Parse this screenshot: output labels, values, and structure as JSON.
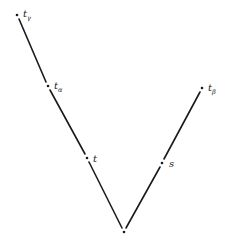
{
  "diagram": {
    "type": "spacetime-v-diagram",
    "points": [
      {
        "id": "t_gamma",
        "label": "t",
        "subscript": "γ",
        "x": 17,
        "y": 15,
        "lx": 23,
        "ly": 16
      },
      {
        "id": "t_alpha",
        "label": "t",
        "subscript": "α",
        "x": 48,
        "y": 86,
        "lx": 54,
        "ly": 88
      },
      {
        "id": "t",
        "label": "t",
        "subscript": "",
        "x": 87,
        "y": 158,
        "lx": 93,
        "ly": 161
      },
      {
        "id": "s",
        "label": "s",
        "subscript": "",
        "x": 162,
        "y": 163,
        "lx": 169,
        "ly": 166
      },
      {
        "id": "t_beta",
        "label": "t",
        "subscript": "β",
        "x": 202,
        "y": 88,
        "lx": 208,
        "ly": 90
      },
      {
        "id": "origin",
        "label": "",
        "subscript": "",
        "x": 124,
        "y": 232,
        "lx": 0,
        "ly": 0
      }
    ],
    "segments": [
      {
        "from": "t_gamma",
        "to": "t_alpha",
        "x1": 19,
        "y1": 19,
        "x2": 46,
        "y2": 82
      },
      {
        "from": "t_alpha",
        "to": "t",
        "x1": 50,
        "y1": 90,
        "x2": 85,
        "y2": 154
      },
      {
        "from": "t",
        "to": "origin",
        "x1": 89,
        "y1": 162,
        "x2": 122,
        "y2": 228
      },
      {
        "from": "origin",
        "to": "s",
        "x1": 126,
        "y1": 228,
        "x2": 160,
        "y2": 167
      },
      {
        "from": "s",
        "to": "t_beta",
        "x1": 164,
        "y1": 159,
        "x2": 200,
        "y2": 92
      }
    ],
    "colors": {
      "ink": "#1a1a1a",
      "background": "#ffffff"
    }
  }
}
